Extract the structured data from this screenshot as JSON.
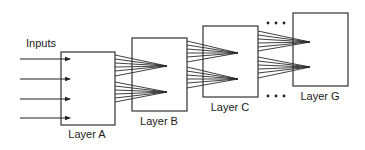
{
  "diagram": {
    "inputs_label": "Inputs",
    "layers": [
      {
        "id": "A",
        "label": "Layer A",
        "x": 61,
        "y": 52,
        "w": 54,
        "h": 73,
        "label_x": 87,
        "label_y": 138
      },
      {
        "id": "B",
        "label": "Layer B",
        "x": 132,
        "y": 38,
        "w": 55,
        "h": 73,
        "label_x": 159,
        "label_y": 125
      },
      {
        "id": "C",
        "label": "Layer C",
        "x": 203,
        "y": 26,
        "w": 55,
        "h": 71,
        "label_x": 230,
        "label_y": 111
      },
      {
        "id": "G",
        "label": "Layer G",
        "x": 293,
        "y": 13,
        "w": 55,
        "h": 73,
        "label_x": 320,
        "label_y": 100
      }
    ],
    "input_arrows_y": [
      59,
      79,
      99,
      118
    ],
    "ellipsis_top": "• • •",
    "ellipsis_bottom": "• • •",
    "colors": {
      "stroke": "#333333",
      "background": "#ffffff",
      "text": "#1a1a1a"
    }
  }
}
